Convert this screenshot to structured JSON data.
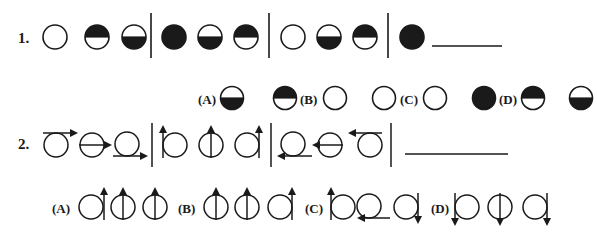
{
  "questions": [
    {
      "number": "1.",
      "type": "circle-shading",
      "groups": [
        [
          "empty",
          "top-filled",
          "bottom-filled"
        ],
        [
          "full",
          "bottom-filled",
          "top-filled"
        ],
        [
          "empty",
          "bottom-filled",
          "top-filled"
        ],
        [
          "full",
          "blank"
        ]
      ],
      "options": [
        {
          "label": "(A)",
          "items": [
            "bottom-filled",
            "top-filled"
          ]
        },
        {
          "label": "(B)",
          "items": [
            "empty",
            "empty"
          ]
        },
        {
          "label": "(C)",
          "items": [
            "empty",
            "full"
          ]
        },
        {
          "label": "(D)",
          "items": [
            "top-filled",
            "bottom-filled"
          ]
        }
      ]
    },
    {
      "number": "2.",
      "type": "circle-arrow",
      "groups": [
        [
          "top-right",
          "middle-right",
          "bottom-right"
        ],
        [
          "left-up",
          "center-up",
          "right-up"
        ],
        [
          "bottom-left",
          "middle-left",
          "top-left"
        ],
        [
          "blank"
        ]
      ],
      "options": [
        {
          "label": "(A)",
          "items": [
            "right-up",
            "center-up",
            "center-up"
          ]
        },
        {
          "label": "(B)",
          "items": [
            "center-up",
            "center-up",
            "right-up"
          ]
        },
        {
          "label": "(C)",
          "items": [
            "left-up",
            "bottom-left",
            "right-down"
          ]
        },
        {
          "label": "(D)",
          "items": [
            "left-down",
            "center-down",
            "right-down"
          ]
        }
      ]
    }
  ],
  "colors": {
    "ink": "#1a1a1a",
    "background": "#ffffff"
  }
}
